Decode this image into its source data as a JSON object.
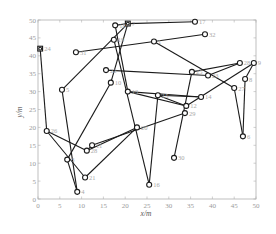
{
  "chart_data": {
    "type": "scatter",
    "title": "",
    "xlabel": "x/m",
    "ylabel": "y/m",
    "xlim": [
      0,
      50
    ],
    "ylim": [
      0,
      50
    ],
    "xticks": [
      0,
      5,
      10,
      15,
      20,
      25,
      30,
      35,
      40,
      45,
      50
    ],
    "yticks": [
      0,
      5,
      10,
      15,
      20,
      25,
      30,
      35,
      40,
      45,
      50
    ],
    "grid": false,
    "legend": null,
    "nodes": [
      {
        "id": "1",
        "x": 26.6,
        "y": 44.0
      },
      {
        "id": "3",
        "x": 6.7,
        "y": 11.0
      },
      {
        "id": "4",
        "x": 9.0,
        "y": 2.0
      },
      {
        "id": "5",
        "x": 5.5,
        "y": 30.5
      },
      {
        "id": "6",
        "x": 47.0,
        "y": 17.5
      },
      {
        "id": "7",
        "x": 20.6,
        "y": 49.0,
        "shape": "square"
      },
      {
        "id": "8",
        "x": 47.5,
        "y": 33.5
      },
      {
        "id": "9",
        "x": 49.5,
        "y": 38.0
      },
      {
        "id": "10",
        "x": 16.7,
        "y": 32.5
      },
      {
        "id": "11",
        "x": 12.4,
        "y": 15.0
      },
      {
        "id": "12",
        "x": 34.0,
        "y": 26.0
      },
      {
        "id": "13",
        "x": 20.6,
        "y": 30.0
      },
      {
        "id": "14",
        "x": 37.4,
        "y": 28.5
      },
      {
        "id": "15",
        "x": 27.5,
        "y": 29.0
      },
      {
        "id": "16",
        "x": 25.5,
        "y": 4.0
      },
      {
        "id": "17",
        "x": 36.0,
        "y": 49.5
      },
      {
        "id": "18",
        "x": 17.7,
        "y": 48.5
      },
      {
        "id": "19",
        "x": 17.4,
        "y": 44.5
      },
      {
        "id": "20",
        "x": 22.7,
        "y": 20.0
      },
      {
        "id": "21",
        "x": 10.8,
        "y": 6.0
      },
      {
        "id": "22",
        "x": 15.6,
        "y": 36.0
      },
      {
        "id": "23",
        "x": 39.0,
        "y": 34.5
      },
      {
        "id": "24",
        "x": 0.5,
        "y": 42.0,
        "shape": "square"
      },
      {
        "id": "25",
        "x": 35.3,
        "y": 35.5
      },
      {
        "id": "26",
        "x": 2.0,
        "y": 19.0
      },
      {
        "id": "27",
        "x": 45.0,
        "y": 31.0
      },
      {
        "id": "28",
        "x": 11.2,
        "y": 13.5
      },
      {
        "id": "28b",
        "label": "28",
        "x": 46.3,
        "y": 38.0
      },
      {
        "id": "29",
        "x": 33.7,
        "y": 24.0
      },
      {
        "id": "30",
        "x": 31.2,
        "y": 11.5
      },
      {
        "id": "31",
        "x": 8.7,
        "y": 41.0
      },
      {
        "id": "32",
        "x": 38.3,
        "y": 46.0
      }
    ],
    "edges": [
      [
        "24",
        "26"
      ],
      [
        "26",
        "28"
      ],
      [
        "28",
        "20"
      ],
      [
        "20",
        "21"
      ],
      [
        "21",
        "26"
      ],
      [
        "5",
        "4"
      ],
      [
        "5",
        "7"
      ],
      [
        "7",
        "17"
      ],
      [
        "18",
        "7"
      ],
      [
        "18",
        "13"
      ],
      [
        "7",
        "10"
      ],
      [
        "10",
        "3"
      ],
      [
        "3",
        "4"
      ],
      [
        "31",
        "1"
      ],
      [
        "1",
        "32"
      ],
      [
        "1",
        "27"
      ],
      [
        "27",
        "6"
      ],
      [
        "6",
        "8"
      ],
      [
        "8",
        "9"
      ],
      [
        "9",
        "12"
      ],
      [
        "12",
        "13"
      ],
      [
        "13",
        "14"
      ],
      [
        "14",
        "15"
      ],
      [
        "15",
        "16"
      ],
      [
        "16",
        "19"
      ],
      [
        "22",
        "23"
      ],
      [
        "23",
        "28b"
      ],
      [
        "28b",
        "25"
      ],
      [
        "25",
        "30"
      ],
      [
        "11",
        "29"
      ],
      [
        "11",
        "28"
      ],
      [
        "12",
        "15"
      ]
    ]
  },
  "axes": {
    "x_label": "x/m",
    "y_label": "y/m"
  }
}
